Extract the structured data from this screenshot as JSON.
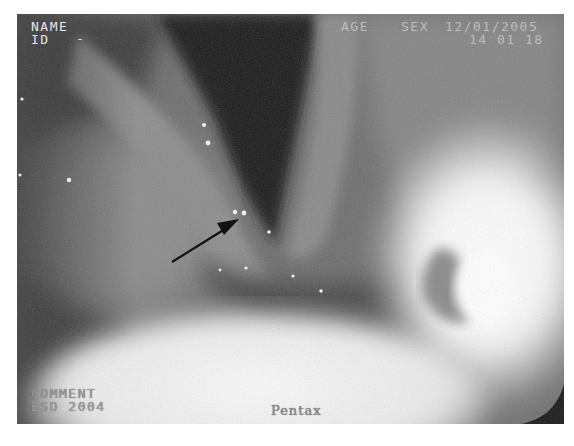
{
  "image": {
    "type": "endoscopy-frame",
    "description": "Grayscale laryngoscopic view of the larynx with an arrow pointing at a lesion on the vocal fold"
  },
  "overlay": {
    "top_left": {
      "name_label": "NAME",
      "id_label": "ID",
      "id_value": "-"
    },
    "top_right": {
      "age_label": "AGE",
      "sex_label": "SEX",
      "date": "12/01/2005",
      "time": "14 01 18"
    },
    "bottom_left": {
      "comment_label": "COMMENT",
      "comment_value": "ESD 2004"
    },
    "bottom_center": {
      "brand": "Pentax"
    }
  },
  "annotation": {
    "arrow": "pointer-arrow",
    "target": "lesion"
  }
}
